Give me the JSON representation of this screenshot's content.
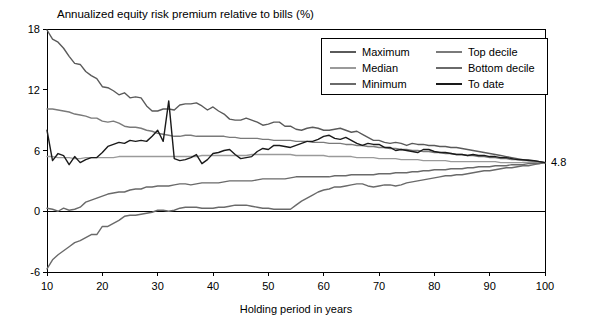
{
  "chart_data": {
    "type": "line",
    "title": "Annualized equity risk premium relative to bills (%)",
    "xlabel": "Holding period in years",
    "ylabel": "",
    "xlim": [
      10,
      100
    ],
    "ylim": [
      -6,
      18
    ],
    "xticks": [
      10,
      20,
      30,
      40,
      50,
      60,
      70,
      80,
      90,
      100
    ],
    "yticks": [
      -6,
      0,
      6,
      12,
      18
    ],
    "grid": false,
    "legend_position": "top-right",
    "annotations": [
      {
        "text": "4.8",
        "x": 100,
        "y": 4.8,
        "anchor": "right-of-axis"
      }
    ],
    "x": [
      10,
      11,
      12,
      13,
      14,
      15,
      16,
      17,
      18,
      19,
      20,
      21,
      22,
      23,
      24,
      25,
      26,
      27,
      28,
      29,
      30,
      31,
      32,
      33,
      34,
      35,
      36,
      37,
      38,
      39,
      40,
      41,
      42,
      43,
      44,
      45,
      46,
      47,
      48,
      49,
      50,
      51,
      52,
      53,
      54,
      55,
      56,
      57,
      58,
      59,
      60,
      61,
      62,
      63,
      64,
      65,
      66,
      67,
      68,
      69,
      70,
      71,
      72,
      73,
      74,
      75,
      76,
      77,
      78,
      79,
      80,
      81,
      82,
      83,
      84,
      85,
      86,
      87,
      88,
      89,
      90,
      91,
      92,
      93,
      94,
      95,
      96,
      97,
      98,
      99,
      100
    ],
    "series": [
      {
        "name": "Maximum",
        "color": "#5a5a5a",
        "values": [
          17.9,
          17.0,
          16.7,
          16.1,
          15.3,
          14.6,
          14.5,
          13.8,
          13.4,
          13.1,
          12.3,
          12.2,
          11.9,
          11.5,
          11.7,
          11.2,
          11.3,
          11.2,
          10.4,
          9.9,
          9.9,
          10.1,
          10.1,
          10.0,
          10.5,
          10.6,
          10.6,
          10.7,
          10.4,
          10.0,
          10.3,
          9.9,
          9.6,
          9.1,
          9.0,
          9.0,
          9.2,
          9.0,
          8.8,
          8.5,
          8.6,
          8.8,
          8.8,
          8.4,
          8.4,
          8.1,
          8.0,
          8.2,
          8.3,
          8.2,
          8.0,
          8.0,
          8.1,
          8.2,
          8.0,
          7.8,
          7.9,
          7.6,
          7.3,
          7.0,
          7.0,
          6.8,
          6.7,
          6.8,
          6.7,
          6.5,
          6.7,
          6.6,
          6.6,
          6.5,
          6.5,
          6.4,
          6.4,
          6.3,
          6.3,
          6.2,
          6.1,
          6.0,
          5.9,
          5.8,
          5.7,
          5.6,
          5.5,
          5.4,
          5.3,
          5.2,
          5.1,
          5.1,
          5.0,
          4.9,
          4.8
        ]
      },
      {
        "name": "Top decile",
        "color": "#7a7a7a",
        "values": [
          10.1,
          10.1,
          10.0,
          9.9,
          9.8,
          9.6,
          9.5,
          9.4,
          9.2,
          9.2,
          8.9,
          8.8,
          8.9,
          8.7,
          8.4,
          8.3,
          8.3,
          8.2,
          8.0,
          7.9,
          7.7,
          7.6,
          7.5,
          7.4,
          7.4,
          7.5,
          7.5,
          7.4,
          7.4,
          7.4,
          7.4,
          7.4,
          7.4,
          7.3,
          7.3,
          7.2,
          7.2,
          7.2,
          7.2,
          7.1,
          7.1,
          7.0,
          7.0,
          7.0,
          7.0,
          6.9,
          6.9,
          6.9,
          6.8,
          6.8,
          6.8,
          6.7,
          6.7,
          6.7,
          6.6,
          6.6,
          6.5,
          6.5,
          6.4,
          6.4,
          6.3,
          6.3,
          6.2,
          6.2,
          6.1,
          6.1,
          6.0,
          6.0,
          5.9,
          5.9,
          5.8,
          5.8,
          5.7,
          5.7,
          5.6,
          5.6,
          5.5,
          5.5,
          5.4,
          5.4,
          5.3,
          5.3,
          5.2,
          5.2,
          5.1,
          5.1,
          5.0,
          5.0,
          4.9,
          4.9,
          4.8
        ]
      },
      {
        "name": "Median",
        "color": "#9a9a9a",
        "values": [
          5.4,
          5.4,
          5.3,
          5.3,
          5.3,
          5.2,
          5.2,
          5.3,
          5.3,
          5.3,
          5.3,
          5.3,
          5.3,
          5.4,
          5.4,
          5.4,
          5.4,
          5.4,
          5.4,
          5.4,
          5.4,
          5.4,
          5.4,
          5.4,
          5.4,
          5.4,
          5.4,
          5.4,
          5.5,
          5.5,
          5.5,
          5.5,
          5.5,
          5.5,
          5.5,
          5.5,
          5.5,
          5.6,
          5.6,
          5.6,
          5.6,
          5.6,
          5.6,
          5.6,
          5.6,
          5.5,
          5.5,
          5.5,
          5.5,
          5.5,
          5.5,
          5.4,
          5.4,
          5.4,
          5.4,
          5.4,
          5.3,
          5.3,
          5.3,
          5.3,
          5.2,
          5.2,
          5.2,
          5.2,
          5.1,
          5.1,
          5.1,
          5.1,
          5.0,
          5.0,
          5.0,
          5.0,
          5.0,
          4.9,
          4.9,
          4.9,
          4.9,
          4.9,
          4.9,
          4.9,
          4.9,
          4.9,
          4.8,
          4.8,
          4.8,
          4.8,
          4.8,
          4.8,
          4.8,
          4.8,
          4.8
        ]
      },
      {
        "name": "Bottom decile",
        "color": "#6a6a6a",
        "values": [
          0.3,
          0.2,
          0.0,
          0.3,
          0.1,
          0.2,
          0.4,
          0.9,
          1.1,
          1.3,
          1.5,
          1.7,
          1.8,
          1.9,
          1.9,
          2.1,
          2.2,
          2.2,
          2.4,
          2.4,
          2.5,
          2.5,
          2.5,
          2.6,
          2.7,
          2.7,
          2.6,
          2.7,
          2.8,
          2.8,
          2.8,
          2.8,
          2.9,
          3.0,
          3.0,
          3.0,
          3.0,
          3.0,
          3.1,
          3.2,
          3.2,
          3.2,
          3.2,
          3.2,
          3.3,
          3.4,
          3.4,
          3.4,
          3.4,
          3.4,
          3.4,
          3.4,
          3.5,
          3.5,
          3.5,
          3.6,
          3.6,
          3.6,
          3.6,
          3.6,
          3.7,
          3.7,
          3.7,
          3.8,
          3.8,
          3.8,
          3.9,
          3.9,
          4.0,
          4.0,
          4.1,
          4.1,
          4.1,
          4.2,
          4.2,
          4.2,
          4.3,
          4.3,
          4.4,
          4.4,
          4.4,
          4.5,
          4.5,
          4.5,
          4.6,
          4.6,
          4.6,
          4.7,
          4.7,
          4.7,
          4.8
        ]
      },
      {
        "name": "Minimum",
        "color": "#6a6a6a",
        "values": [
          -5.7,
          -4.8,
          -4.3,
          -3.9,
          -3.5,
          -3.1,
          -2.9,
          -2.6,
          -2.3,
          -2.3,
          -1.5,
          -1.5,
          -1.2,
          -0.9,
          -0.5,
          -0.4,
          -0.4,
          -0.3,
          -0.2,
          -0.1,
          0.1,
          0.1,
          0.0,
          0.1,
          0.3,
          0.4,
          0.4,
          0.4,
          0.3,
          0.3,
          0.3,
          0.4,
          0.4,
          0.5,
          0.6,
          0.6,
          0.6,
          0.5,
          0.4,
          0.3,
          0.3,
          0.2,
          0.2,
          0.2,
          0.2,
          0.6,
          1.0,
          1.3,
          1.6,
          1.9,
          2.1,
          2.2,
          2.4,
          2.4,
          2.5,
          2.6,
          2.7,
          2.7,
          2.5,
          2.4,
          2.5,
          2.6,
          2.6,
          2.5,
          2.6,
          2.8,
          2.9,
          3.0,
          3.1,
          3.2,
          3.3,
          3.4,
          3.5,
          3.5,
          3.6,
          3.6,
          3.7,
          3.8,
          3.9,
          4.0,
          4.0,
          4.1,
          4.2,
          4.3,
          4.3,
          4.4,
          4.5,
          4.5,
          4.6,
          4.7,
          4.8
        ]
      },
      {
        "name": "To date",
        "color": "#1a1a1a",
        "values": [
          8.0,
          5.0,
          5.7,
          5.5,
          4.6,
          5.4,
          4.8,
          5.1,
          5.3,
          5.3,
          5.8,
          6.4,
          6.6,
          6.8,
          6.7,
          7.0,
          6.9,
          7.0,
          6.9,
          7.4,
          8.0,
          6.9,
          10.9,
          5.2,
          5.0,
          5.1,
          5.3,
          5.6,
          4.7,
          5.1,
          5.7,
          5.8,
          6.0,
          6.1,
          5.6,
          5.2,
          5.3,
          5.4,
          5.9,
          6.2,
          6.1,
          6.5,
          6.5,
          6.4,
          6.3,
          6.5,
          6.7,
          6.9,
          6.9,
          7.1,
          7.4,
          7.5,
          7.2,
          7.1,
          7.3,
          7.0,
          6.7,
          6.5,
          6.7,
          6.6,
          6.6,
          6.3,
          6.3,
          6.0,
          6.1,
          6.0,
          5.9,
          5.8,
          6.1,
          6.1,
          5.9,
          5.8,
          5.8,
          5.7,
          5.6,
          5.6,
          5.5,
          5.6,
          5.5,
          5.5,
          5.4,
          5.4,
          5.3,
          5.3,
          5.2,
          5.1,
          5.1,
          5.0,
          5.0,
          4.9,
          4.8
        ]
      }
    ],
    "legend": [
      {
        "label": "Maximum",
        "color": "#5a5a5a"
      },
      {
        "label": "Top decile",
        "color": "#7a7a7a"
      },
      {
        "label": "Median",
        "color": "#9a9a9a"
      },
      {
        "label": "Bottom decile",
        "color": "#6a6a6a"
      },
      {
        "label": "Minimum",
        "color": "#6a6a6a"
      },
      {
        "label": "To date",
        "color": "#1a1a1a"
      }
    ]
  }
}
